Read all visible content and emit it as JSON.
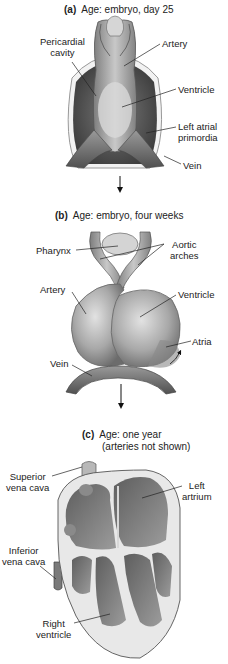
{
  "panels": [
    {
      "letter": "(a)",
      "title": "Age: embryo, day 25",
      "labels": {
        "pericardial_cavity_1": "Pericardial",
        "pericardial_cavity_2": "cavity",
        "artery": "Artery",
        "ventricle": "Ventricle",
        "left_atrial_1": "Left atrial",
        "left_atrial_2": "primordia",
        "vein": "Vein"
      }
    },
    {
      "letter": "(b)",
      "title": "Age: embryo, four weeks",
      "labels": {
        "pharynx": "Pharynx",
        "aortic_1": "Aortic",
        "aortic_2": "arches",
        "artery": "Artery",
        "ventricle": "Ventricle",
        "atria": "Atria",
        "vein": "Vein"
      }
    },
    {
      "letter": "(c)",
      "title": "Age: one year",
      "subtitle": "(arteries not shown)",
      "labels": {
        "superior_1": "Superior",
        "superior_2": "vena cava",
        "left_atrium_1": "Left",
        "left_atrium_2": "artrium",
        "inferior_1": "Inferior",
        "inferior_2": "vena cava",
        "right_ventricle_1": "Right",
        "right_ventricle_2": "ventricle"
      }
    }
  ],
  "colors": {
    "tissue_light": "#c9c9c9",
    "tissue_mid": "#9a9a9a",
    "tissue_dark": "#4a4a4a",
    "leader_line": "#222222",
    "arrow": "#111111"
  }
}
